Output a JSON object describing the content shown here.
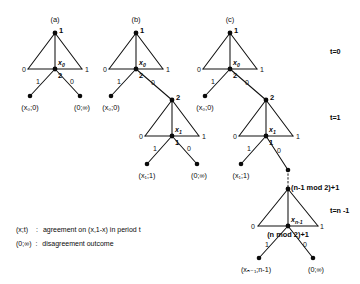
{
  "figure": {
    "panels": [
      {
        "id": "a",
        "label": "(a)"
      },
      {
        "id": "b",
        "label": "(b)"
      },
      {
        "id": "c",
        "label": "(c)"
      }
    ],
    "period_labels": [
      {
        "id": "t0",
        "text": "t=0"
      },
      {
        "id": "t1",
        "text": "t=1"
      },
      {
        "id": "tn",
        "text": "t=n -1"
      }
    ],
    "players": {
      "one": "1",
      "two": "2",
      "mod_upper": "(n-1 mod 2)+1",
      "mod_lower": "(n mod 2)+1"
    },
    "offers": {
      "x0": "x",
      "x0_sub": "0",
      "x1": "x",
      "x1_sub": "1",
      "xn": "x",
      "xn_sub": "n-1"
    },
    "edge_labels": {
      "zero": "0",
      "one": "1"
    },
    "leaves": {
      "a_left": "(x₀;0)",
      "a_right": "(0;∞)",
      "b_left": "(x₀;0)",
      "b_mid": "(x₁;1)",
      "b_right": "(0;∞)",
      "c_left": "(x₀;0)",
      "c_mid": "(x₁;1)",
      "c_bottom_left": "(xₙ₋₁;n-1)",
      "c_bottom_right": "(0;∞)"
    },
    "legend": [
      {
        "key": "(x;t)",
        "sep": ":",
        "desc": "agreement on (x,1-x) in period t"
      },
      {
        "key": "(0;∞)",
        "sep": ":",
        "desc": "disagreement outcome"
      }
    ],
    "colors": {
      "ink": "#111111",
      "background": "#ffffff"
    }
  }
}
